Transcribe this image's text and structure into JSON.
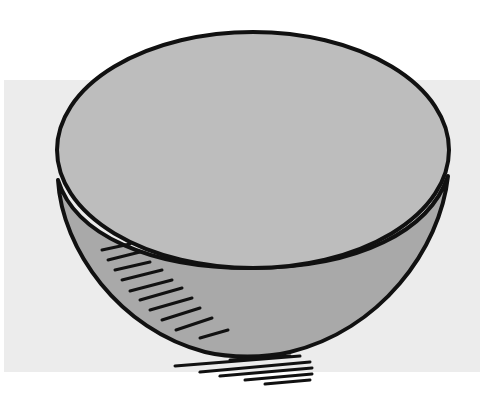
{
  "image": {
    "subject": "hemisphere-bowl",
    "description": "Line drawing of a hemispherical bowl with a flat elliptical top face, hatch shading on the left side, and scribbled shadow below",
    "colors": {
      "background": "#ffffff",
      "panel": "#ececec",
      "top_face": "#bdbdbd",
      "bowl_body": "#a9a9a9",
      "outline": "#111111"
    }
  }
}
